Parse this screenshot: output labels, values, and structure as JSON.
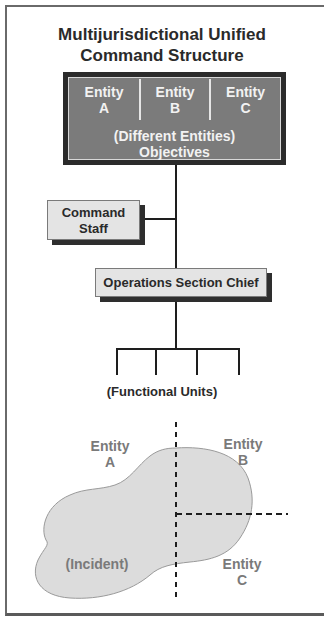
{
  "title": {
    "line1": "Multijurisdictional Unified",
    "line2": "Command Structure"
  },
  "unified_command": {
    "entities": [
      {
        "line1": "Entity",
        "line2": "A"
      },
      {
        "line1": "Entity",
        "line2": "B"
      },
      {
        "line1": "Entity",
        "line2": "C"
      }
    ],
    "subtitle": "(Different Entities)",
    "objectives": "Objectives"
  },
  "command_staff": {
    "line1": "Command",
    "line2": "Staff"
  },
  "operations": {
    "label": "Operations Section Chief"
  },
  "functional_units": {
    "label": "(Functional Units)",
    "count": 4
  },
  "incident_map": {
    "incident_label": "(Incident)",
    "regions": [
      {
        "line1": "Entity",
        "line2": "A"
      },
      {
        "line1": "Entity",
        "line2": "B"
      },
      {
        "line1": "Entity",
        "line2": "C"
      }
    ]
  },
  "colors": {
    "dark_border": "#2b2b2b",
    "panel_gray": "#7b7b7b",
    "box_fill": "#e4e4e4",
    "incident_fill": "#dcdcdc",
    "map_text": "#7a7a7a"
  }
}
